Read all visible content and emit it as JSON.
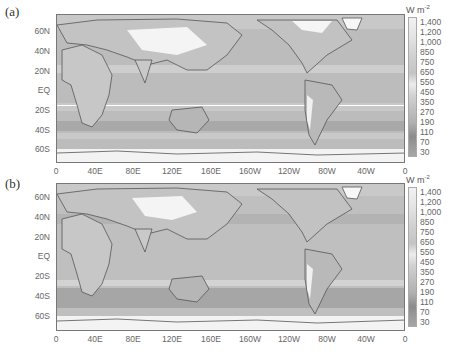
{
  "figure": {
    "panels": [
      {
        "label": "(a)",
        "y_ticks": [
          "60N",
          "40N",
          "20N",
          "EQ",
          "20S",
          "40S",
          "60S"
        ],
        "x_ticks": [
          "0",
          "40E",
          "80E",
          "120E",
          "160E",
          "160W",
          "120W",
          "80W",
          "40W",
          "0"
        ],
        "colorbar": {
          "unit": "W m",
          "unit_exp": "-2",
          "levels": [
            "1,400",
            "1,200",
            "1,000",
            "850",
            "750",
            "650",
            "550",
            "450",
            "350",
            "270",
            "190",
            "110",
            "70",
            "30"
          ]
        }
      },
      {
        "label": "(b)",
        "y_ticks": [
          "60N",
          "40N",
          "20N",
          "EQ",
          "20S",
          "40S",
          "60S"
        ],
        "x_ticks": [
          "0",
          "40E",
          "80E",
          "120E",
          "160E",
          "160W",
          "120W",
          "80W",
          "40W",
          "0"
        ],
        "colorbar": {
          "unit": "W m",
          "unit_exp": "-2",
          "levels": [
            "1,400",
            "1,200",
            "1,000",
            "850",
            "750",
            "650",
            "550",
            "450",
            "350",
            "270",
            "190",
            "110",
            "70",
            "30"
          ]
        }
      }
    ],
    "colorbar_colors": [
      "#f2f2f2",
      "#e4e4e4",
      "#d9d9d9",
      "#cfcfcf",
      "#c6c6c6",
      "#bdbdbd",
      "#e8e8e8",
      "#d4d4d4",
      "#c4c4c4",
      "#b8b8b8",
      "#adadad",
      "#8e8e8e",
      "#999999",
      "#a4a4a4"
    ]
  }
}
